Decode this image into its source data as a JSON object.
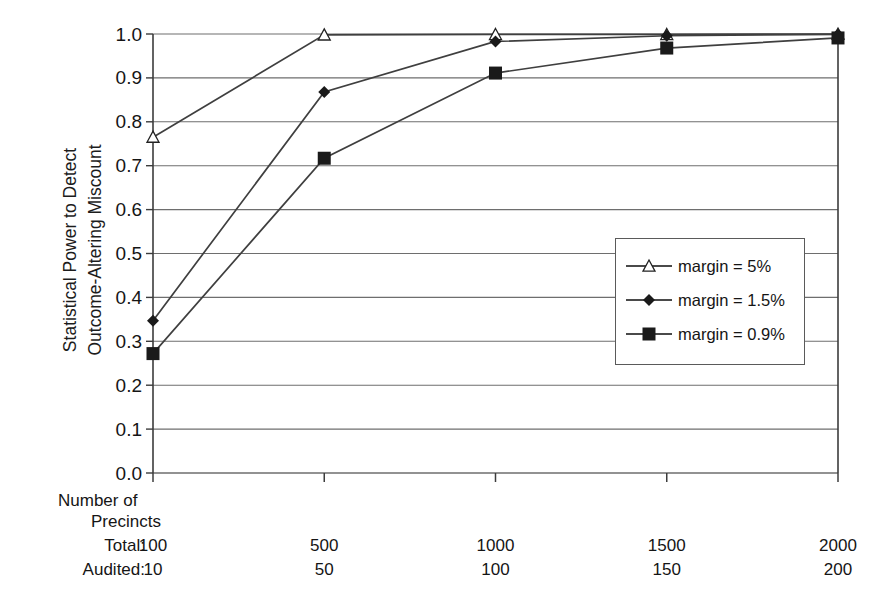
{
  "chart_data": {
    "type": "line",
    "title": "",
    "xlabel": "Number of Precincts",
    "ylabel": "Statistical Power to Detect\nOutcome-Altering Miscount",
    "categories": [
      "100",
      "500",
      "1000",
      "1500",
      "2000"
    ],
    "x_axis_rows": [
      {
        "label": "Total:",
        "values": [
          "100",
          "500",
          "1000",
          "1500",
          "2000"
        ]
      },
      {
        "label": "Audited:",
        "values": [
          "10",
          "50",
          "100",
          "150",
          "200"
        ]
      }
    ],
    "x_header_line1": "Number of",
    "x_header_line2": "Precincts",
    "ylim": [
      0.0,
      1.0
    ],
    "yticks": [
      "1.0",
      "0.9",
      "0.8",
      "0.7",
      "0.6",
      "0.5",
      "0.4",
      "0.3",
      "0.2",
      "0.1",
      "0.0"
    ],
    "grid": true,
    "legend_position": "center-right",
    "series": [
      {
        "name": "margin = 5%",
        "marker": "triangle-open",
        "color": "#3f3f3f",
        "values": [
          0.765,
          0.998,
          0.999,
          0.999,
          1.0
        ]
      },
      {
        "name": "margin = 1.5%",
        "marker": "diamond-filled",
        "color": "#3f3f3f",
        "values": [
          0.347,
          0.868,
          0.983,
          0.996,
          0.999
        ]
      },
      {
        "name": "margin = 0.9%",
        "marker": "square-filled",
        "color": "#3f3f3f",
        "values": [
          0.272,
          0.717,
          0.911,
          0.968,
          0.991
        ]
      }
    ]
  },
  "legend": {
    "items": [
      {
        "label": "margin = 5%",
        "marker": "triangle-open-icon"
      },
      {
        "label": "margin = 1.5%",
        "marker": "diamond-filled-icon"
      },
      {
        "label": "margin = 0.9%",
        "marker": "square-filled-icon"
      }
    ]
  },
  "colors": {
    "line": "#4a4a4a",
    "grid": "#6e6e6e",
    "axis": "#3c3c3c",
    "text": "#151515",
    "background": "#ffffff"
  }
}
